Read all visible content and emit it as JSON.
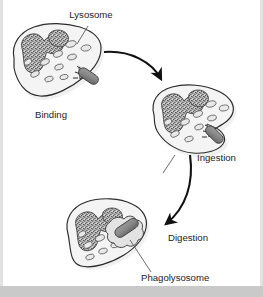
{
  "figure": {
    "labels": [
      {
        "id": "lysosome",
        "text": "Lysosome",
        "x": 91,
        "y": 18
      },
      {
        "id": "binding",
        "text": "Binding",
        "x": 35,
        "y": 118
      },
      {
        "id": "ingestion",
        "text": "Ingestion",
        "x": 197,
        "y": 161
      },
      {
        "id": "digestion",
        "text": "Digestion",
        "x": 168,
        "y": 241
      },
      {
        "id": "phagolysosome",
        "text": "Phagolysosome",
        "x": 141,
        "y": 281
      }
    ],
    "colors": {
      "outline": "#2b2b2b",
      "cytoplasm": "#f4f4f4",
      "nucleus_stipple": "#4a4a4a",
      "nucleus_fill": "#b9b9b9",
      "lysosome_fill": "#e8e8e8",
      "bacterium_fill": "#8a8a8a",
      "arrow": "#111111",
      "leader_line": "#5a5a5a",
      "footer": "#c9c9c9",
      "edge": "#e2e2e2",
      "text": "#1d1d1d"
    },
    "stages": [
      {
        "id": "stage-binding",
        "order": 1,
        "label": "Binding",
        "description": "Phagocyte membrane receptors bind the rod-shaped bacterium at the cell surface."
      },
      {
        "id": "stage-ingestion",
        "order": 2,
        "label": "Ingestion",
        "description": "Pseudopodia extend around the bacterium and engulf it into a phagosome."
      },
      {
        "id": "stage-digestion",
        "order": 3,
        "label": "Digestion",
        "description": "Lysosomes fuse with the phagosome forming a phagolysosome that digests the bacterium."
      }
    ],
    "organelles": [
      {
        "id": "nucleus",
        "name": "nucleus",
        "appearance": "irregular lobed stippled mass"
      },
      {
        "id": "lysosome",
        "name": "lysosome",
        "appearance": "small pale oval vesicles"
      },
      {
        "id": "bacterium",
        "name": "bacterium",
        "appearance": "dark grey rounded rod"
      },
      {
        "id": "phagolysosome",
        "name": "phagolysosome",
        "appearance": "lobed vacuole enclosing the bacterium"
      }
    ],
    "arrows": [
      {
        "id": "arrow-binding-to-ingestion",
        "from": "stage-binding",
        "to": "stage-ingestion"
      },
      {
        "id": "arrow-ingestion-to-digestion",
        "from": "stage-ingestion",
        "to": "stage-digestion"
      }
    ]
  }
}
